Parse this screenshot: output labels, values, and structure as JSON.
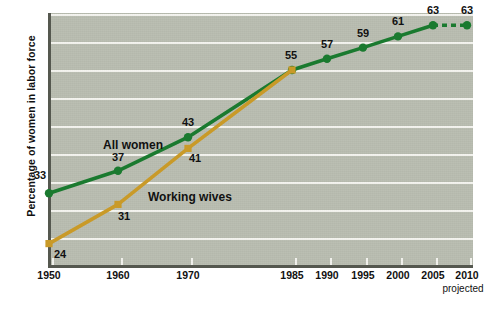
{
  "chart_data": {
    "type": "line",
    "title": "",
    "xlabel": "",
    "ylabel": "Percentage of women in labor force",
    "categories": [
      "1950",
      "1960",
      "1970",
      "1985",
      "1990",
      "1995",
      "2000",
      "2005",
      "2010"
    ],
    "x_tick_labels": [
      "1950",
      "1960",
      "1970",
      "1985",
      "1990",
      "1995",
      "2000",
      "2005",
      "2010"
    ],
    "y_tick_labels": [
      "0",
      "25",
      "30",
      "35",
      "40",
      "45",
      "50",
      "55",
      "60",
      "65"
    ],
    "y_tick_values": [
      0,
      25,
      30,
      35,
      40,
      45,
      50,
      55,
      60,
      65
    ],
    "ylim": [
      0,
      65
    ],
    "grid": "horizontal",
    "legend": "inline-labels",
    "annotations": [
      "projected"
    ],
    "series": [
      {
        "name": "All women",
        "color": "#1a7a2f",
        "x": [
          "1950",
          "1960",
          "1970",
          "1985",
          "1990",
          "1995",
          "2000",
          "2005",
          "2010"
        ],
        "values": [
          33,
          37,
          43,
          55,
          57,
          59,
          61,
          63,
          63
        ],
        "point_labels": [
          "33",
          "37",
          "43",
          "55",
          "57",
          "59",
          "61",
          "63",
          "63"
        ],
        "projected_from": "2005",
        "projected_to": "2010",
        "projected_style": "dashed"
      },
      {
        "name": "Working wives",
        "color": "#c99a28",
        "x": [
          "1950",
          "1960",
          "1970",
          "1985"
        ],
        "values": [
          24,
          31,
          41,
          55
        ],
        "point_labels": [
          "24",
          "31",
          "41",
          ""
        ],
        "merges_into": "All women"
      }
    ]
  },
  "axis": {
    "y_title": "Percentage of women in labor force",
    "projected_note": "projected"
  },
  "series_labels": {
    "all_women": "All women",
    "working_wives": "Working wives"
  }
}
